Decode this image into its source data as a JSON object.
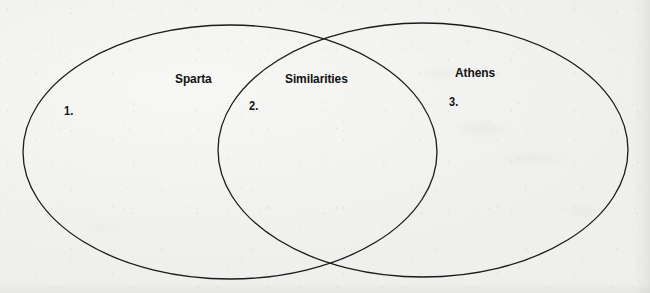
{
  "diagram": {
    "type": "venn-diagram",
    "background_color": "#f2f2f0",
    "stroke_color": "#1a1a1a",
    "stroke_width": 1.3,
    "regions": [
      {
        "id": "left-only",
        "label": "Sparta",
        "label_x": 175,
        "label_y": 72,
        "number": "1.",
        "number_x": 64,
        "number_y": 105
      },
      {
        "id": "intersection",
        "label": "Similarities",
        "label_x": 285,
        "label_y": 72,
        "number": "2.",
        "number_x": 249,
        "number_y": 100
      },
      {
        "id": "right-only",
        "label": "Athens",
        "label_x": 455,
        "label_y": 66,
        "number": "3.",
        "number_x": 449,
        "number_y": 96
      }
    ],
    "ellipses": [
      {
        "id": "left-ellipse",
        "cx": 230,
        "cy": 152,
        "rx": 207,
        "ry": 127
      },
      {
        "id": "right-ellipse",
        "cx": 423,
        "cy": 150,
        "rx": 205,
        "ry": 127
      }
    ]
  }
}
